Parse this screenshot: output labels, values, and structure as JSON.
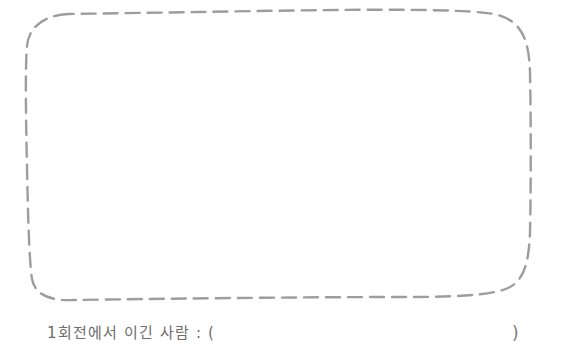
{
  "page": {
    "name": "worksheet-answer-box",
    "background_color": "#ffffff",
    "width": 562,
    "height": 347
  },
  "answer_box": {
    "name": "answer-box",
    "style": "hand-drawn dashed rounded rectangle",
    "stroke_color": "#9d9d9d",
    "stroke_width": 2.4,
    "dash_length": 14,
    "dash_gap": 8,
    "corner_radius": 42,
    "content": "",
    "placeholder": ""
  },
  "prompt": {
    "name": "winner-prompt",
    "label": "1회전에서 이긴 사람 : (",
    "close_paren": ")",
    "answer_value": "",
    "text_color": "#6d6d6d"
  }
}
